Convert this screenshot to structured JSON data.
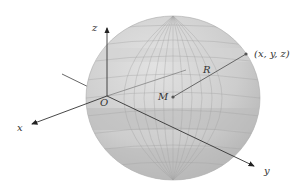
{
  "figure": {
    "type": "sphere-coordinate-diagram",
    "colors": {
      "sphere_fill": "#c9c9c9",
      "sphere_light": "#dcdcdc",
      "sphere_dark": "#b4b4b4",
      "grid": "#9a9a9a",
      "axis": "#444444",
      "radius_line": "#666666"
    },
    "labels": {
      "z_axis": "z",
      "x_axis": "x",
      "y_axis": "y",
      "origin": "O",
      "center": "M",
      "radius": "R",
      "point": "(x, y, z)"
    }
  }
}
